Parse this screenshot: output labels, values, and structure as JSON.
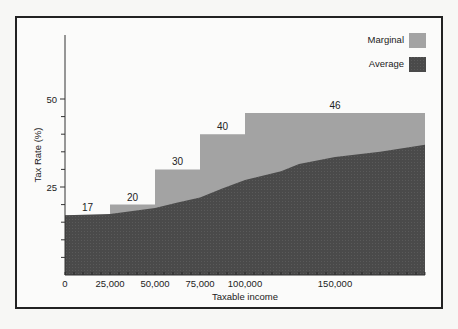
{
  "chart_data": {
    "type": "area",
    "title": "",
    "xlabel": "Taxable income",
    "ylabel": "Tax Rate (%)",
    "xlim": [
      0,
      200000
    ],
    "ylim": [
      0,
      65
    ],
    "grid": false,
    "legend_position": "top-right",
    "x_ticks": [
      {
        "value": 0,
        "label": "0"
      },
      {
        "value": 25000,
        "label": "25,000"
      },
      {
        "value": 50000,
        "label": "50,000"
      },
      {
        "value": 75000,
        "label": "75,000"
      },
      {
        "value": 100000,
        "label": "100,000"
      },
      {
        "value": 150000,
        "label": "150,000"
      }
    ],
    "y_ticks": [
      {
        "value": 25,
        "label": "25"
      },
      {
        "value": 50,
        "label": "50"
      }
    ],
    "series": [
      {
        "name": "Marginal",
        "type": "step",
        "color": "#a3a3a3",
        "brackets": [
          {
            "from": 0,
            "to": 25000,
            "rate": 17,
            "label": "17"
          },
          {
            "from": 25000,
            "to": 50000,
            "rate": 20,
            "label": "20"
          },
          {
            "from": 50000,
            "to": 75000,
            "rate": 30,
            "label": "30"
          },
          {
            "from": 75000,
            "to": 100000,
            "rate": 40,
            "label": "40"
          },
          {
            "from": 100000,
            "to": 200000,
            "rate": 46,
            "label": "46"
          }
        ]
      },
      {
        "name": "Average",
        "type": "area",
        "color": "#4a4a4a",
        "x": [
          0,
          25000,
          50000,
          62000,
          75000,
          87000,
          100000,
          120000,
          130000,
          150000,
          175000,
          200000
        ],
        "values": [
          17,
          17.3,
          19,
          20.5,
          22,
          24.5,
          27,
          29.5,
          31.5,
          33.5,
          35,
          37
        ]
      }
    ],
    "legend": [
      {
        "label": "Marginal",
        "color": "#a3a3a3"
      },
      {
        "label": "Average",
        "color": "#4a4a4a"
      }
    ]
  }
}
